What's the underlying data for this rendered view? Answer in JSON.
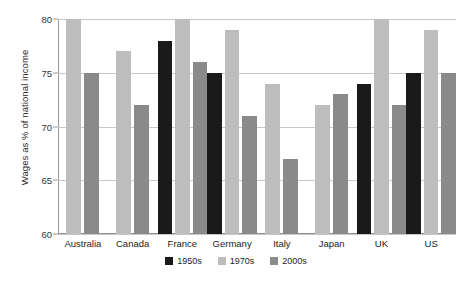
{
  "chart_data": {
    "type": "bar",
    "title": "",
    "xlabel": "",
    "ylabel": "Wages as % of national income",
    "ylim": [
      60,
      80
    ],
    "yticks": [
      60,
      65,
      70,
      75,
      80
    ],
    "grid": true,
    "legend_position": "bottom",
    "categories": [
      "Australia",
      "Canada",
      "France",
      "Germany",
      "Italy",
      "Japan",
      "UK",
      "US"
    ],
    "series": [
      {
        "name": "1950s",
        "color": "#1a1a1a",
        "values": [
          null,
          null,
          78,
          75,
          null,
          null,
          74,
          75
        ]
      },
      {
        "name": "1970s",
        "color": "#bdbdbd",
        "values": [
          80,
          77,
          80,
          79,
          74,
          72,
          80,
          79
        ]
      },
      {
        "name": "2000s",
        "color": "#8a8a8a",
        "values": [
          75,
          72,
          76,
          71,
          67,
          73,
          72,
          75
        ]
      }
    ]
  }
}
